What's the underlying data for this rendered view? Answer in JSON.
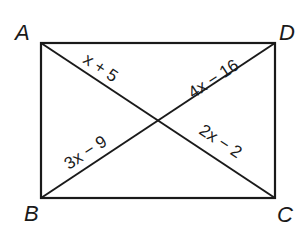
{
  "diagram": {
    "type": "rectangle-with-diagonals",
    "vertices": [
      {
        "name": "A",
        "label": "A",
        "position": "top-left"
      },
      {
        "name": "D",
        "label": "D",
        "position": "top-right"
      },
      {
        "name": "B",
        "label": "B",
        "position": "bottom-left"
      },
      {
        "name": "C",
        "label": "C",
        "position": "bottom-right"
      }
    ],
    "segments": {
      "upper_left": {
        "label": "x + 5",
        "from": "A",
        "to": "center"
      },
      "upper_right": {
        "label": "4x − 16",
        "from": "center",
        "to": "D"
      },
      "lower_left": {
        "label": "3x − 9",
        "from": "B",
        "to": "center"
      },
      "lower_right": {
        "label": "2x − 2",
        "from": "center",
        "to": "C"
      }
    },
    "line_color": "#1a1a1a",
    "background": "#ffffff"
  }
}
